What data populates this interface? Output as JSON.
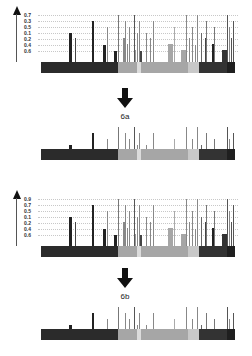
{
  "chart_data": [
    {
      "type": "bar",
      "title": "",
      "ylabel": "",
      "xlabel": "",
      "grid": true,
      "tick_labels": [
        "0.7",
        "0.3",
        "0.5",
        "0.1",
        "0.2",
        "0.4",
        "0.6"
      ],
      "segments": [
        {
          "from": 41,
          "to": 118,
          "color": "#2b2b2b"
        },
        {
          "from": 118,
          "to": 137,
          "color": "#a6a6a6"
        },
        {
          "from": 137,
          "to": 141,
          "color": "#dcdcdc"
        },
        {
          "from": 141,
          "to": 188,
          "color": "#a6a6a6"
        },
        {
          "from": 188,
          "to": 199,
          "color": "#c8c8c8"
        },
        {
          "from": 199,
          "to": 227,
          "color": "#333333"
        },
        {
          "from": 227,
          "to": 235,
          "color": "#1f1f1f"
        }
      ],
      "spikes": [
        {
          "x": 69,
          "top": 33,
          "w": 3,
          "color": "#222"
        },
        {
          "x": 75,
          "top": 38,
          "w": 1,
          "color": "#444"
        },
        {
          "x": 92,
          "top": 21,
          "w": 2,
          "color": "#222"
        },
        {
          "x": 103,
          "top": 45,
          "w": 3,
          "color": "#222"
        },
        {
          "x": 107,
          "top": 27,
          "w": 1,
          "color": "#888"
        },
        {
          "x": 114,
          "top": 51,
          "w": 3,
          "color": "#222"
        },
        {
          "x": 118,
          "top": 15,
          "w": 1,
          "color": "#777"
        },
        {
          "x": 123,
          "top": 38,
          "w": 2,
          "color": "#888"
        },
        {
          "x": 125,
          "top": 21,
          "w": 1,
          "color": "#888"
        },
        {
          "x": 127,
          "top": 44,
          "w": 1,
          "color": "#888"
        },
        {
          "x": 129,
          "top": 27,
          "w": 1,
          "color": "#888"
        },
        {
          "x": 134,
          "top": 50,
          "w": 2,
          "color": "#999"
        },
        {
          "x": 134,
          "top": 15,
          "w": 1,
          "color": "#555"
        },
        {
          "x": 137,
          "top": 33,
          "w": 1,
          "color": "#888"
        },
        {
          "x": 139,
          "top": 21,
          "w": 1,
          "color": "#888"
        },
        {
          "x": 140,
          "top": 51,
          "w": 2,
          "color": "#444"
        },
        {
          "x": 146,
          "top": 33,
          "w": 1,
          "color": "#888"
        },
        {
          "x": 150,
          "top": 38,
          "w": 1,
          "color": "#888"
        },
        {
          "x": 153,
          "top": 21,
          "w": 1,
          "color": "#888"
        },
        {
          "x": 168,
          "top": 44,
          "w": 5,
          "color": "#a6a6a6"
        },
        {
          "x": 174,
          "top": 27,
          "w": 1,
          "color": "#aaa"
        },
        {
          "x": 181,
          "top": 50,
          "w": 5,
          "color": "#a6a6a6"
        },
        {
          "x": 186,
          "top": 15,
          "w": 1,
          "color": "#888"
        },
        {
          "x": 189,
          "top": 38,
          "w": 1,
          "color": "#888"
        },
        {
          "x": 192,
          "top": 27,
          "w": 1,
          "color": "#888"
        },
        {
          "x": 195,
          "top": 45,
          "w": 1,
          "color": "#888"
        },
        {
          "x": 197,
          "top": 15,
          "w": 1,
          "color": "#888"
        },
        {
          "x": 201,
          "top": 33,
          "w": 1,
          "color": "#666"
        },
        {
          "x": 205,
          "top": 38,
          "w": 2,
          "color": "#444"
        },
        {
          "x": 206,
          "top": 21,
          "w": 1,
          "color": "#777"
        },
        {
          "x": 212,
          "top": 44,
          "w": 3,
          "color": "#222"
        },
        {
          "x": 214,
          "top": 27,
          "w": 1,
          "color": "#777"
        },
        {
          "x": 222,
          "top": 50,
          "w": 5,
          "color": "#333"
        },
        {
          "x": 227,
          "top": 15,
          "w": 1,
          "color": "#555"
        },
        {
          "x": 229,
          "top": 27,
          "w": 1,
          "color": "#888"
        },
        {
          "x": 231,
          "top": 38,
          "w": 1,
          "color": "#555"
        },
        {
          "x": 233,
          "top": 21,
          "w": 1,
          "color": "#555"
        }
      ]
    },
    {
      "type": "bar",
      "title": "",
      "ylabel": "",
      "xlabel": "",
      "grid": true,
      "tick_labels": [
        "0.9",
        "0.7",
        "0.5",
        "0.1",
        "0.2",
        "0.4",
        "0.6"
      ]
    }
  ],
  "panels": {
    "step_a": {
      "label": "6a"
    },
    "step_b": {
      "label": "6b"
    }
  }
}
